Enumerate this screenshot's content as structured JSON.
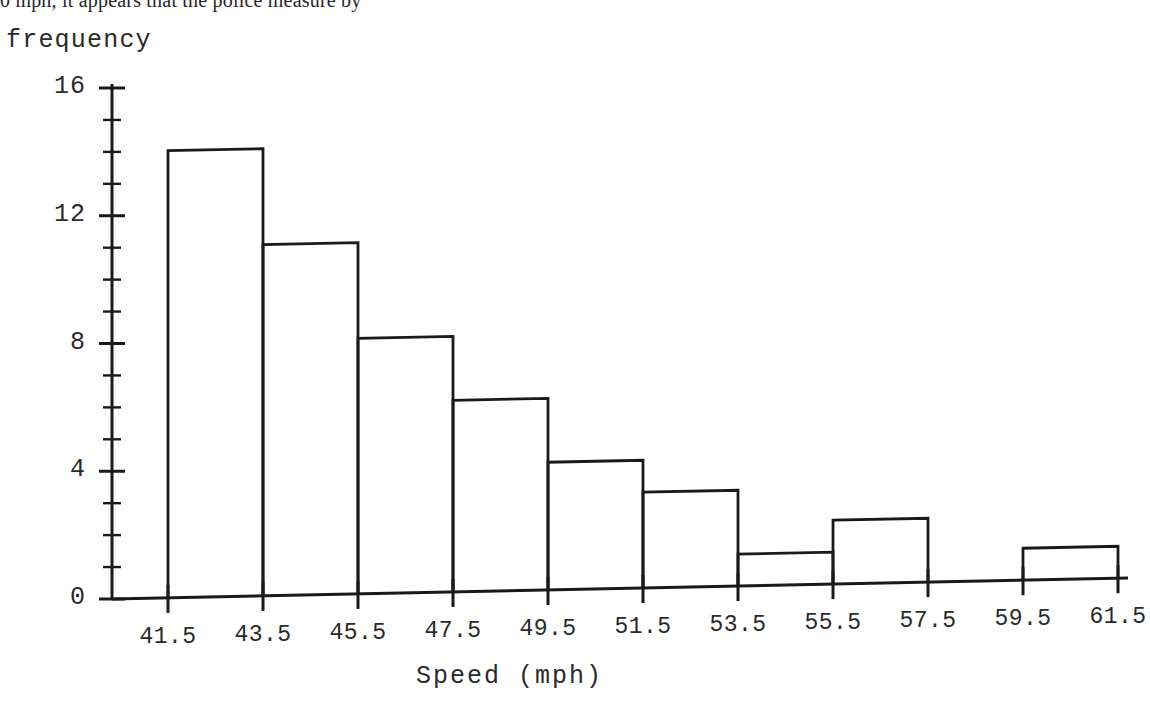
{
  "page": {
    "cut_off_body_text": "0 mph, it appears that the police measure by",
    "background_color": "#ffffff",
    "ink_color": "#1a1a1a"
  },
  "chart_data": {
    "type": "bar",
    "title": "",
    "subtitle": "",
    "xlabel": "Speed (mph)",
    "ylabel": "frequency",
    "grid": false,
    "legend": null,
    "bin_width": 2,
    "bin_edges": [
      41.5,
      43.5,
      45.5,
      47.5,
      49.5,
      51.5,
      53.5,
      55.5,
      57.5,
      59.5,
      61.5
    ],
    "categories": [
      "41.5-43.5",
      "43.5-45.5",
      "45.5-47.5",
      "47.5-49.5",
      "49.5-51.5",
      "51.5-53.5",
      "53.5-55.5",
      "55.5-57.5",
      "57.5-59.5",
      "59.5-61.5"
    ],
    "values": [
      14,
      11,
      8,
      6,
      4,
      3,
      1,
      2,
      0,
      1
    ],
    "bars": [
      {
        "left": 41.5,
        "right": 43.5,
        "value": 14
      },
      {
        "left": 43.5,
        "right": 45.5,
        "value": 11
      },
      {
        "left": 45.5,
        "right": 47.5,
        "value": 8
      },
      {
        "left": 47.5,
        "right": 49.5,
        "value": 6
      },
      {
        "left": 49.5,
        "right": 51.5,
        "value": 4
      },
      {
        "left": 51.5,
        "right": 53.5,
        "value": 3
      },
      {
        "left": 53.5,
        "right": 55.5,
        "value": 1
      },
      {
        "left": 55.5,
        "right": 57.5,
        "value": 2
      },
      {
        "left": 57.5,
        "right": 59.5,
        "value": 0
      },
      {
        "left": 59.5,
        "right": 61.5,
        "value": 1
      }
    ],
    "xlim": [
      40.3,
      62.7
    ],
    "ylim": [
      0,
      16
    ],
    "x_tick_labels": [
      "41.5",
      "43.5",
      "45.5",
      "47.5",
      "49.5",
      "51.5",
      "53.5",
      "55.5",
      "57.5",
      "59.5",
      "61.5"
    ],
    "x_tick_values": [
      41.5,
      43.5,
      45.5,
      47.5,
      49.5,
      51.5,
      53.5,
      55.5,
      57.5,
      59.5,
      61.5
    ],
    "y_tick_labels": [
      "0",
      "4",
      "8",
      "12",
      "16"
    ],
    "y_tick_values": [
      0,
      4,
      8,
      12,
      16
    ],
    "y_minor_tick_step": 1,
    "total_frequency": 50
  }
}
